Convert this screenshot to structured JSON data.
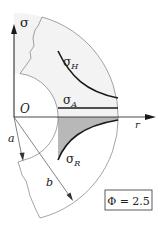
{
  "diagram": {
    "axes": {
      "vertical_label": "σ",
      "horizontal_label": "r",
      "origin_label": "O"
    },
    "radii": {
      "inner_label": "a",
      "outer_label": "b"
    },
    "curves": [
      {
        "id": "hoop",
        "label_main": "σ",
        "label_sub": "H"
      },
      {
        "id": "axial",
        "label_main": "σ",
        "label_sub": "A"
      },
      {
        "id": "radial",
        "label_main": "σ",
        "label_sub": "R"
      }
    ],
    "parameter_box": {
      "text": "Φ = 2.5"
    },
    "colors": {
      "line": "#1a1a1a",
      "thin_line": "#555555",
      "shade_dark": "#b8b8b8",
      "shade_light": "#efefef"
    }
  }
}
